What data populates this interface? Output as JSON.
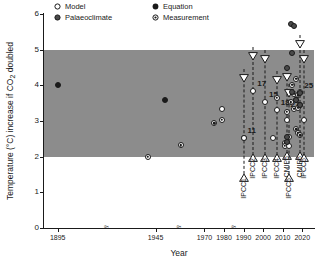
{
  "chart_data": {
    "type": "scatter",
    "title": "",
    "xlabel": "Year",
    "ylabel": "Temperature (°C) increase if CO₂ doubled",
    "xlim": [
      1888,
      2026
    ],
    "ylim": [
      0,
      6
    ],
    "yticks": [
      0,
      1,
      2,
      3,
      4,
      5,
      6
    ],
    "xticks": [
      1895,
      1945,
      1970,
      1980,
      1990,
      2000,
      2010,
      2020
    ],
    "xtick_labels": [
      "1895",
      "1945",
      "1970",
      "1980",
      "1990",
      "2000",
      "2010",
      "2020"
    ],
    "axis_breaks": [
      1920,
      1957,
      1985
    ],
    "axis_break_glyph": "≈",
    "grid": false,
    "legend_position": "top-left",
    "shaded_band": {
      "label": "Likely range 2–5 °C",
      "ymin": 2.0,
      "ymax": 5.0,
      "color": "#8c8c8c"
    },
    "legend": [
      {
        "key": "model",
        "label": "Model",
        "symbol": "open-circle"
      },
      {
        "key": "equation",
        "label": "Equation",
        "symbol": "filled-circle"
      },
      {
        "key": "palaeoclimate",
        "label": "Palaeoclimate",
        "symbol": "dark-circle"
      },
      {
        "key": "measurement",
        "label": "Measurement",
        "symbol": "dotted-circle"
      }
    ],
    "series": [
      {
        "name": "Equation",
        "marker": "filled-circle",
        "points": [
          {
            "x": 1895,
            "y": 4.0
          },
          {
            "x": 1950,
            "y": 3.6
          }
        ]
      },
      {
        "name": "Measurement",
        "marker": "dotted-circle",
        "points": [
          {
            "x": 1941,
            "y": 2.0
          },
          {
            "x": 1958,
            "y": 2.32
          },
          {
            "x": 1975,
            "y": 2.93
          },
          {
            "x": 1979,
            "y": 3.03
          },
          {
            "x": 1990,
            "y": 2.52
          },
          {
            "x": 2007,
            "y": 3.65
          },
          {
            "x": 2011,
            "y": 2.38
          },
          {
            "x": 2011,
            "y": 2.3
          },
          {
            "x": 2012,
            "y": 3.25
          },
          {
            "x": 2013,
            "y": 2.55
          },
          {
            "x": 2014,
            "y": 3.52
          },
          {
            "x": 2015,
            "y": 4.02
          },
          {
            "x": 2016,
            "y": 3.77
          },
          {
            "x": 2016,
            "y": 3.34
          },
          {
            "x": 2017,
            "y": 4.18
          },
          {
            "x": 2017,
            "y": 3.6
          },
          {
            "x": 2017,
            "y": 2.77
          },
          {
            "x": 2018,
            "y": 3.72
          },
          {
            "x": 2018,
            "y": 3.37
          },
          {
            "x": 2018,
            "y": 2.66
          },
          {
            "x": 2019,
            "y": 3.8
          },
          {
            "x": 2019,
            "y": 3.45
          },
          {
            "x": 2019,
            "y": 2.6
          }
        ]
      },
      {
        "name": "Model",
        "marker": "open-circle",
        "points": [
          {
            "x": 1979,
            "y": 3.34
          },
          {
            "x": 1990,
            "y": 2.52
          },
          {
            "x": 1995,
            "y": 3.85
          },
          {
            "x": 2001,
            "y": 3.52
          },
          {
            "x": 2005,
            "y": 2.52
          },
          {
            "x": 2007,
            "y": 3.3
          },
          {
            "x": 2012,
            "y": 3.03
          },
          {
            "x": 2013,
            "y": 2.3
          },
          {
            "x": 2021,
            "y": 3.03
          }
        ]
      },
      {
        "name": "Palaeoclimate",
        "marker": "dark-circle",
        "points": [
          {
            "x": 2014,
            "y": 5.72
          },
          {
            "x": 2016,
            "y": 5.65
          },
          {
            "x": 2015,
            "y": 4.92
          },
          {
            "x": 2012,
            "y": 4.48
          },
          {
            "x": 2015,
            "y": 3.8
          },
          {
            "x": 2017,
            "y": 3.6
          },
          {
            "x": 2019,
            "y": 3.78
          },
          {
            "x": 2019,
            "y": 3.45
          },
          {
            "x": 2012,
            "y": 2.55
          },
          {
            "x": 2012,
            "y": 2.42
          }
        ]
      }
    ],
    "assessments": [
      {
        "name": "IPCC1",
        "x": 1990,
        "low": 1.5,
        "high": 4.45,
        "best": 2.52,
        "count": "11"
      },
      {
        "name": "IPCC2",
        "x": 1995,
        "low": 2.05,
        "high": 5.08,
        "best": 3.85,
        "count": "17"
      },
      {
        "name": "IPCC3",
        "x": 2001,
        "low": 2.05,
        "high": 5.0,
        "best": 3.52,
        "count": "15"
      },
      {
        "name": "IPCC4",
        "x": 2007,
        "low": 2.05,
        "high": 4.4,
        "best": 3.3,
        "count": "18"
      },
      {
        "name": "CMIP5",
        "x": 2012,
        "low": 2.1,
        "high": 4.48,
        "best": 3.25,
        "count": "27"
      },
      {
        "name": "IPCC5",
        "x": 2013,
        "low": 1.5,
        "high": 4.05,
        "best": 3.03,
        "count": ""
      },
      {
        "name": "CMIP6",
        "x": 2019,
        "low": 2.1,
        "high": 5.4,
        "best": 3.78,
        "count": "25"
      },
      {
        "name": "IPCC6",
        "x": 2021,
        "low": 2.05,
        "high": 5.0,
        "best": 3.03,
        "count": ""
      }
    ]
  }
}
